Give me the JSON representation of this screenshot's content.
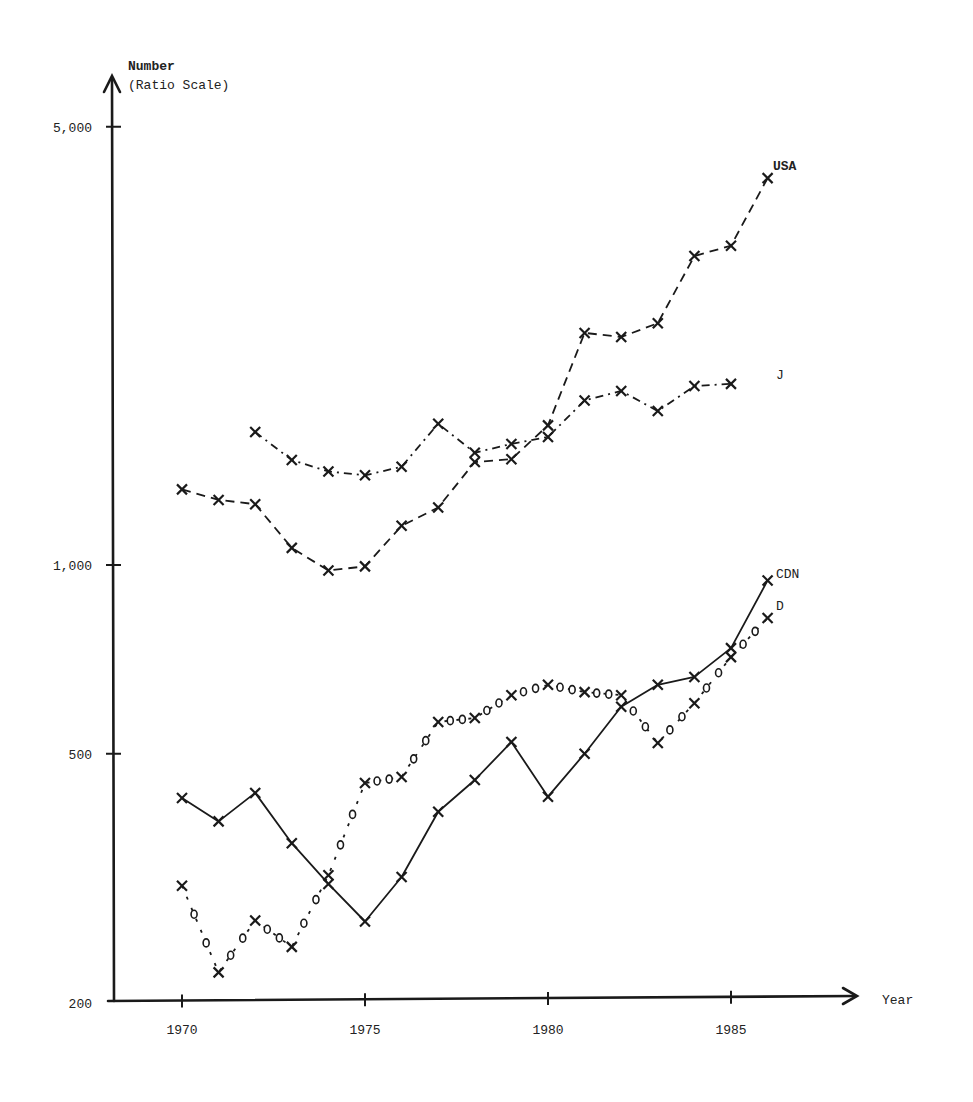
{
  "chart_data": {
    "type": "line",
    "title": "",
    "xlabel": "Year",
    "ylabel": "Number",
    "ylabel_sub": "(Ratio Scale)",
    "yscale": "log",
    "ylim": [
      200,
      5000
    ],
    "xlim": [
      1970,
      1985
    ],
    "x_ticks": [
      1970,
      1975,
      1980,
      1985
    ],
    "x_tick_labels": [
      "1970",
      "1975",
      "1980",
      "1985"
    ],
    "y_ticks": [
      200,
      500,
      1000,
      5000
    ],
    "y_tick_labels": [
      "200",
      "500",
      "1,000",
      "5,000"
    ],
    "grid": false,
    "legend_position": "inline labels at right end of each series",
    "series": [
      {
        "name": "USA",
        "style": "dashed",
        "label_bold": true,
        "x": [
          1970,
          1971,
          1972,
          1973,
          1974,
          1975,
          1976,
          1977,
          1978,
          1979,
          1980,
          1981,
          1982,
          1983,
          1984,
          1985,
          1986
        ],
        "values": [
          1320,
          1270,
          1250,
          1065,
          980,
          995,
          1155,
          1235,
          1460,
          1475,
          1670,
          2345,
          2310,
          2430,
          3110,
          3230,
          4140
        ]
      },
      {
        "name": "J",
        "style": "dash-dot",
        "label_bold": false,
        "x": [
          1972,
          1973,
          1974,
          1975,
          1976,
          1977,
          1978,
          1979,
          1980,
          1981,
          1982,
          1983,
          1984,
          1985
        ],
        "values": [
          1630,
          1470,
          1410,
          1390,
          1435,
          1680,
          1510,
          1560,
          1600,
          1830,
          1895,
          1760,
          1930,
          1945
        ]
      },
      {
        "name": "CDN",
        "style": "solid",
        "label_bold": false,
        "x": [
          1970,
          1971,
          1972,
          1973,
          1974,
          1975,
          1976,
          1977,
          1978,
          1979,
          1980,
          1981,
          1982,
          1983,
          1984,
          1985,
          1986
        ],
        "values": [
          425,
          390,
          433,
          360,
          310,
          270,
          318,
          404,
          454,
          522,
          427,
          500,
          594,
          644,
          663,
          737,
          945
        ]
      },
      {
        "name": "D",
        "style": "o-o dotted",
        "label_bold": false,
        "x": [
          1970,
          1971,
          1972,
          1973,
          1974,
          1975,
          1976,
          1977,
          1978,
          1979,
          1980,
          1981,
          1982,
          1983,
          1984,
          1985,
          1986
        ],
        "values": [
          308,
          224,
          271,
          246,
          320,
          449,
          459,
          562,
          570,
          620,
          644,
          627,
          620,
          520,
          602,
          713,
          823
        ]
      }
    ]
  },
  "labels": {
    "y_title": "Number",
    "y_subtitle": "(Ratio Scale)",
    "x_title": "Year",
    "series_usa": "USA",
    "series_j": "J",
    "series_cdn": "CDN",
    "series_d": "D"
  },
  "colors": {
    "ink": "#1a1a1a",
    "background": "#ffffff"
  }
}
